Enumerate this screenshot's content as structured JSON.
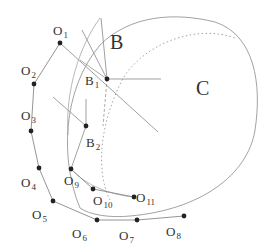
{
  "diagram": {
    "regions": [
      {
        "id": "B",
        "label": "B",
        "x": 110,
        "y": 49,
        "size": 20
      },
      {
        "id": "C",
        "label": "C",
        "x": 196,
        "y": 95,
        "size": 20
      }
    ],
    "points": [
      {
        "id": "O1",
        "base": "O",
        "sub": "1",
        "x": 60,
        "y": 43,
        "lx": 53,
        "ly": 35
      },
      {
        "id": "O2",
        "base": "O",
        "sub": "2",
        "x": 34,
        "y": 84,
        "lx": 21,
        "ly": 75
      },
      {
        "id": "O3",
        "base": "O",
        "sub": "3",
        "x": 31,
        "y": 131,
        "lx": 21,
        "ly": 120
      },
      {
        "id": "O4",
        "base": "O",
        "sub": "4",
        "x": 39,
        "y": 168,
        "lx": 21,
        "ly": 187
      },
      {
        "id": "O5",
        "base": "O",
        "sub": "5",
        "x": 53,
        "y": 201,
        "lx": 32,
        "ly": 219
      },
      {
        "id": "O6",
        "base": "O",
        "sub": "6",
        "x": 97,
        "y": 220,
        "lx": 72,
        "ly": 238
      },
      {
        "id": "O7",
        "base": "O",
        "sub": "7",
        "x": 137,
        "y": 220,
        "lx": 119,
        "ly": 240
      },
      {
        "id": "O8",
        "base": "O",
        "sub": "8",
        "x": 184,
        "y": 216,
        "lx": 166,
        "ly": 236
      },
      {
        "id": "O9",
        "base": "O",
        "sub": "9",
        "x": 71,
        "y": 169,
        "lx": 64,
        "ly": 185
      },
      {
        "id": "O10",
        "base": "O",
        "sub": "10",
        "x": 93,
        "y": 189,
        "lx": 93,
        "ly": 205
      },
      {
        "id": "O11",
        "base": "O",
        "sub": "11",
        "x": 134,
        "y": 197,
        "lx": 136,
        "ly": 202
      },
      {
        "id": "B1",
        "base": "B",
        "sub": "1",
        "x": 107,
        "y": 79,
        "lx": 85,
        "ly": 85
      },
      {
        "id": "B2",
        "base": "B",
        "sub": "2",
        "x": 86,
        "y": 126,
        "lx": 86,
        "ly": 147
      }
    ],
    "outer_chain": [
      "O1",
      "O2",
      "O3",
      "O4",
      "O5",
      "O6",
      "O7",
      "O8"
    ],
    "inner_chain": [
      "O9",
      "O10",
      "O11"
    ],
    "colors": {
      "ink": "#222222",
      "line": "#888888",
      "dotted": "#999999"
    }
  }
}
